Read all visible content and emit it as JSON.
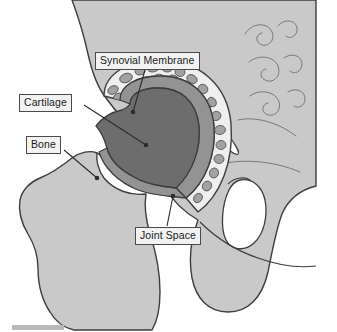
{
  "figure": {
    "view": "coronal-section"
  },
  "labels": {
    "synovial_membrane": "Synovial Membrane",
    "cartilage": "Cartilage",
    "bone": "Bone",
    "joint_space": "Joint Space"
  },
  "colors": {
    "bone_fill": "#c9c9c9",
    "bone_outline": "#3d3d3d",
    "femoral_head_fill": "#6d6d6d",
    "cartilage_fill": "#939393",
    "synovial_band_fill": "#efefef",
    "trabecula_fill": "#a2a2a2",
    "foramen_fill": "#ffffff",
    "callout_fill": "#f2f2f2",
    "callout_border": "#4a4a4a",
    "leader_line": "#2b2b2b",
    "page_background": "#ffffff"
  },
  "structures": [
    {
      "name": "pelvis",
      "label": "Bone",
      "shade": "light-gray"
    },
    {
      "name": "femur",
      "label": "Bone",
      "shade": "light-gray"
    },
    {
      "name": "femoral-head",
      "label": "Cartilage",
      "shade": "dark-gray"
    },
    {
      "name": "articular-cartilage-ring",
      "label": "Joint Space",
      "shade": "mid-gray"
    },
    {
      "name": "synovial-membrane-band",
      "label": "Synovial Membrane",
      "shade": "white-with-trabeculae"
    },
    {
      "name": "acetabular-notch",
      "label": "",
      "shade": "white"
    },
    {
      "name": "obturator-foramen",
      "label": "",
      "shade": "white"
    }
  ]
}
